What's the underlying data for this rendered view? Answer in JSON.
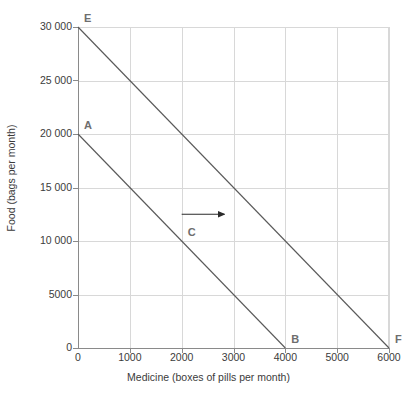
{
  "chart_data": {
    "type": "line",
    "title": "",
    "xlabel": "Medicine (boxes of pills per month)",
    "ylabel": "Food (bags per month)",
    "xlim": [
      0,
      6000
    ],
    "ylim": [
      0,
      30000
    ],
    "grid": true,
    "legend": "none",
    "x_ticks": [
      "0",
      "1000",
      "2000",
      "3000",
      "4000",
      "5000",
      "6000"
    ],
    "x_tick_values": [
      0,
      1000,
      2000,
      3000,
      4000,
      5000,
      6000
    ],
    "y_ticks": [
      "0",
      "5000",
      "10 000",
      "15 000",
      "20 000",
      "25 000",
      "30 000"
    ],
    "y_tick_values": [
      0,
      5000,
      10000,
      15000,
      20000,
      25000,
      30000
    ],
    "series": [
      {
        "name": "AB",
        "x": [
          0,
          4000
        ],
        "values": [
          20000,
          0
        ],
        "color": "#595959"
      },
      {
        "name": "EF",
        "x": [
          0,
          6000
        ],
        "values": [
          30000,
          0
        ],
        "color": "#595959"
      }
    ],
    "annotations": [
      {
        "label": "E",
        "x": 0,
        "y": 30000,
        "dx": 6,
        "dy": -14
      },
      {
        "label": "A",
        "x": 0,
        "y": 20000,
        "dx": 6,
        "dy": -14
      },
      {
        "label": "C",
        "x": 2000,
        "y": 10000,
        "dx": 6,
        "dy": -14
      },
      {
        "label": "B",
        "x": 4000,
        "y": 0,
        "dx": 6,
        "dy": -14
      },
      {
        "label": "F",
        "x": 6000,
        "y": 0,
        "dx": 6,
        "dy": -14
      }
    ],
    "arrow": {
      "name": "shift-arrow",
      "x_start": 2000,
      "x_end": 2900,
      "y": 12500,
      "direction": "right",
      "color": "#2b2b2b"
    },
    "colors": {
      "line": "#595959",
      "grid": "#d8d8d8",
      "axis": "#8a8a8a",
      "text": "#3b3b3b",
      "point_label": "#6e6e6e",
      "background": "#ffffff"
    }
  }
}
